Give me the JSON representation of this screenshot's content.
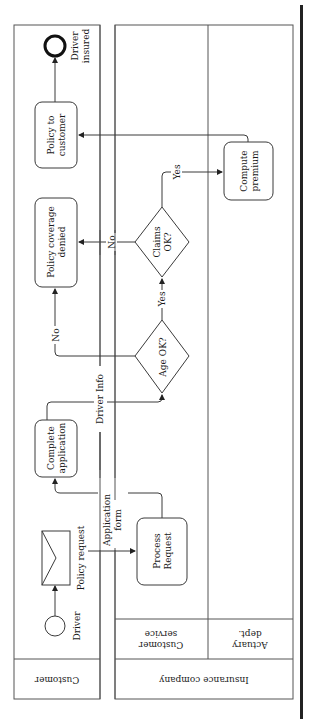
{
  "diagram": {
    "type": "BPMN collaboration (rotated 90°)",
    "pools": [
      {
        "id": "customer",
        "label": "Customer",
        "lanes": []
      },
      {
        "id": "insurance",
        "label": "Insurance company",
        "lanes": [
          {
            "id": "cs",
            "label_line1": "Customer",
            "label_line2": "service"
          },
          {
            "id": "actuary",
            "label_line1": "Actuary",
            "label_line2": "dept."
          }
        ]
      }
    ],
    "events": {
      "start": {
        "label": "Driver"
      },
      "end": {
        "label_line1": "Driver",
        "label_line2": "insured"
      },
      "message": {
        "label": "Policy request"
      }
    },
    "tasks": {
      "complete_application": {
        "line1": "Complete",
        "line2": "application"
      },
      "policy_denied": {
        "line1": "Policy coverage",
        "line2": "denied"
      },
      "policy_to_customer": {
        "line1": "Policy to",
        "line2": "customer"
      },
      "process_request": {
        "line1": "Process",
        "line2": "Request"
      },
      "compute_premium": {
        "line1": "Compute",
        "line2": "premium"
      }
    },
    "gateways": {
      "age": {
        "label": "Age OK?"
      },
      "claims": {
        "line1": "Claims",
        "line2": "OK?"
      }
    },
    "flow_labels": {
      "driver_info": "Driver Info",
      "application_form_1": "Application",
      "application_form_2": "form",
      "age_no": "No",
      "age_yes": "Yes",
      "claims_no": "No",
      "claims_yes": "Yes"
    }
  }
}
